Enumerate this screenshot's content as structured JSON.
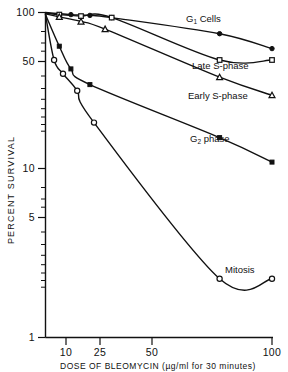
{
  "chart_data": {
    "type": "line",
    "title": "",
    "xlabel": "DOSE OF BLEOMYCIN (µg/ml for 30 minutes)",
    "ylabel": "PERCENT SURVIVAL",
    "xscale": "log",
    "yscale": "log",
    "xlim": [
      5,
      100
    ],
    "ylim": [
      1,
      100
    ],
    "xticks": [
      10,
      25,
      50,
      100
    ],
    "xticklabels": [
      "10",
      "25",
      "50",
      "100"
    ],
    "yticks": [
      1,
      5,
      10,
      50,
      100
    ],
    "yticklabels": [
      "1",
      "5",
      "10",
      "50",
      "100"
    ],
    "grid": false,
    "legend_position": "inline-right-of-curves",
    "series": [
      {
        "name": "G1 Cells",
        "label_text": "Cells",
        "label_prefix": "G",
        "label_sub": "1",
        "marker": "filled-circle",
        "x": [
          5,
          7,
          9,
          12,
          50,
          100
        ],
        "y": [
          100,
          97,
          96,
          93,
          74,
          60
        ]
      },
      {
        "name": "Late S-phase",
        "label_text": "Late S-phase",
        "marker": "open-square",
        "x": [
          5,
          6,
          8,
          12,
          50,
          100
        ],
        "y": [
          99,
          97,
          95,
          93,
          51,
          51
        ]
      },
      {
        "name": "Early S-phase",
        "label_text": "Early S-phase",
        "marker": "open-triangle",
        "x": [
          5,
          6,
          8,
          11,
          50,
          100
        ],
        "y": [
          98,
          94,
          88,
          79,
          40,
          31
        ]
      },
      {
        "name": "G2 phase",
        "label_text": "phase",
        "label_prefix": "G",
        "label_sub": "2",
        "marker": "filled-square",
        "x": [
          5,
          6,
          7,
          9,
          50,
          100
        ],
        "y": [
          97,
          62,
          45,
          36,
          17,
          12
        ]
      },
      {
        "name": "Mitosis",
        "label_text": "Mitosis",
        "marker": "open-circle",
        "x": [
          5,
          5.6,
          6.3,
          7.6,
          9.5,
          50,
          100
        ],
        "y": [
          97,
          51,
          42,
          33,
          21,
          2.3,
          2.3
        ]
      }
    ],
    "annotations": [
      {
        "text": "G1 Cells",
        "x_px": 186,
        "y_px": 22
      },
      {
        "text": "Late S-phase",
        "x_px": 192,
        "y_px": 69
      },
      {
        "text": "Early S-phase",
        "x_px": 188,
        "y_px": 99
      },
      {
        "text": "G2 phase",
        "x_px": 190,
        "y_px": 142
      },
      {
        "text": "Mitosis",
        "x_px": 225,
        "y_px": 273
      }
    ]
  }
}
